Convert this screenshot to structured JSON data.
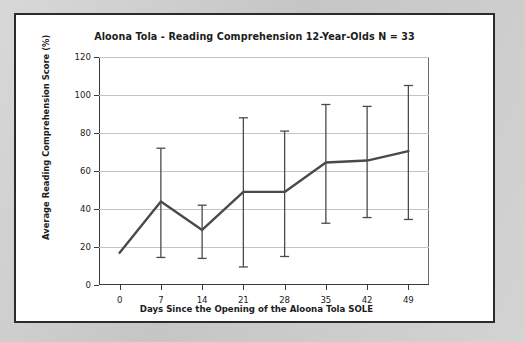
{
  "figure": {
    "title": "Aloona Tola - Reading Comprehension 12-Year-Olds N = 33",
    "background_color": "#c9c9c9",
    "panel_color": "#ffffff",
    "border_color": "#2b2b2b",
    "series_color": "#4a4a4a",
    "gridline_color": "#c4c4c4"
  },
  "chart_data": {
    "type": "line",
    "title": "Aloona Tola - Reading Comprehension 12-Year-Olds N = 33",
    "xlabel": "Days Since the Opening of the Aloona Tola SOLE",
    "ylabel": "Average Reading Comprehension Score (%)",
    "x": [
      0,
      7,
      14,
      21,
      28,
      35,
      42,
      49
    ],
    "xticklabels": [
      "0",
      "7",
      "14",
      "21",
      "28",
      "35",
      "42",
      "49"
    ],
    "yticklabels": [
      "0",
      "20",
      "40",
      "60",
      "80",
      "100",
      "120"
    ],
    "yticks": [
      0,
      20,
      40,
      60,
      80,
      100,
      120
    ],
    "xlim": [
      -3.5,
      52.5
    ],
    "ylim": [
      0,
      120
    ],
    "grid": "horizontal",
    "legend": "none",
    "series": [
      {
        "name": "Average Reading Comprehension Score",
        "values": [
          17,
          44,
          29,
          49,
          49,
          64.5,
          65.5,
          70.5
        ],
        "error_upper": [
          17,
          72,
          42,
          88,
          81,
          95,
          94,
          105
        ],
        "error_lower": [
          17,
          14.5,
          14,
          9.5,
          15,
          32.5,
          35.5,
          34.5
        ],
        "has_error_bars": true,
        "error_bar_note": "Day 0 has no visible error bar"
      }
    ]
  }
}
